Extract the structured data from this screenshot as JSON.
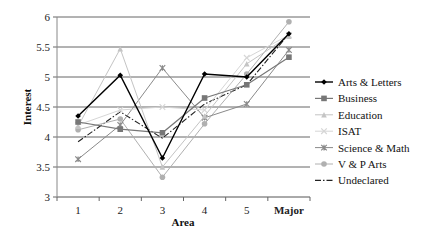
{
  "chart_data": {
    "type": "line",
    "title": "",
    "xlabel": "Area",
    "ylabel": "Interest",
    "categories": [
      "1",
      "2",
      "3",
      "4",
      "5",
      "Major"
    ],
    "ylim": [
      3,
      6
    ],
    "yticks": [
      "3",
      "3.5",
      "4",
      "4.5",
      "5",
      "5.5",
      "6"
    ],
    "grid": "horizontal",
    "legend_position": "right",
    "series": [
      {
        "name": "Arts & Letters",
        "values": [
          4.35,
          5.03,
          3.65,
          5.05,
          5.0,
          5.72
        ],
        "color": "#000000",
        "marker": "diamond",
        "dash": "solid",
        "width": 1.4
      },
      {
        "name": "Business",
        "values": [
          4.25,
          4.13,
          4.07,
          4.65,
          4.87,
          5.33
        ],
        "color": "#777777",
        "marker": "square",
        "dash": "solid",
        "width": 1.2
      },
      {
        "name": "Education",
        "values": [
          4.18,
          5.47,
          3.5,
          4.35,
          5.22,
          5.68
        ],
        "color": "#c4c4c4",
        "marker": "triangle",
        "dash": "solid",
        "width": 1.0
      },
      {
        "name": "ISAT",
        "values": [
          4.2,
          4.45,
          4.5,
          4.45,
          5.32,
          5.7
        ],
        "color": "#d6d6d6",
        "marker": "x",
        "dash": "solid",
        "width": 1.0
      },
      {
        "name": "Science & Math",
        "values": [
          3.63,
          4.2,
          5.15,
          4.32,
          4.55,
          5.45
        ],
        "color": "#8a8a8a",
        "marker": "star",
        "dash": "solid",
        "width": 1.0
      },
      {
        "name": "V & P Arts",
        "values": [
          4.12,
          4.3,
          3.33,
          4.22,
          5.05,
          5.92
        ],
        "color": "#b0b0b0",
        "marker": "circle",
        "dash": "solid",
        "width": 1.0
      },
      {
        "name": "Undeclared",
        "values": [
          3.92,
          4.42,
          3.98,
          4.55,
          4.87,
          5.72
        ],
        "color": "#222222",
        "marker": "none",
        "dash": "dashdot",
        "width": 1.1
      }
    ]
  },
  "legend": {
    "items": [
      "Arts & Letters",
      "Business",
      "Education",
      "ISAT",
      "Science & Math",
      "V & P Arts",
      "Undeclared"
    ]
  },
  "axes": {
    "x_title": "Area",
    "y_title": "Interest"
  }
}
